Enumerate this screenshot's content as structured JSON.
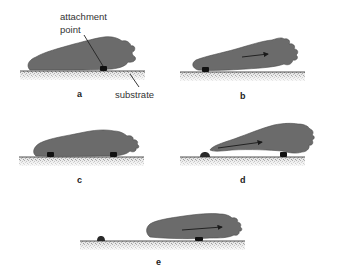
{
  "figure": {
    "type": "diagram",
    "colors": {
      "cell": "#6b6b6b",
      "cell_edge": "#4a4a4a",
      "attachment": "#111111",
      "substrate_line": "#555555",
      "substrate_fill": "#cfcfcf",
      "text": "#333333"
    },
    "annotations": {
      "attachment_point": {
        "line1": "attachment",
        "line2": "point"
      },
      "substrate": "substrate"
    },
    "panels": [
      {
        "id": "a",
        "label": "a",
        "arrow": false,
        "attachments": 1
      },
      {
        "id": "b",
        "label": "b",
        "arrow": true,
        "attachments": 1
      },
      {
        "id": "c",
        "label": "c",
        "arrow": false,
        "attachments": 2
      },
      {
        "id": "d",
        "label": "d",
        "arrow": true,
        "attachments": 2,
        "detached_remnant": true
      },
      {
        "id": "e",
        "label": "e",
        "arrow": true,
        "attachments": 1,
        "detached_remnant": true
      }
    ]
  }
}
